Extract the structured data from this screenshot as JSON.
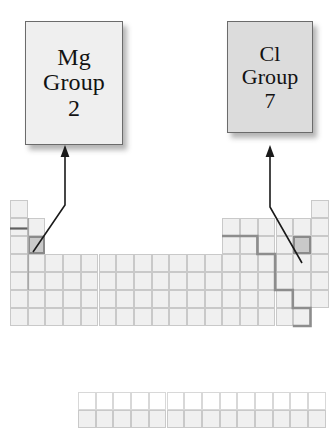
{
  "figure": {
    "kind": "periodic-table-diagram",
    "background": "#ffffff"
  },
  "callouts": [
    {
      "id": "mg",
      "element_symbol": "Mg",
      "group_word": "Group",
      "group_number": "2",
      "box_fill": "#efefef",
      "border_color": "#6b6b6b"
    },
    {
      "id": "cl",
      "element_symbol": "Cl",
      "group_word": "Group",
      "group_number": "7",
      "box_fill": "#dcdcdc",
      "border_color": "#6b6b6b"
    }
  ],
  "table": {
    "columns": 18,
    "cell_width": 17.7,
    "cell_height": 18,
    "origin_x": 10,
    "origin_y": 200,
    "cell_fill": "#f0f0f0",
    "cell_border": "#c9c9c9",
    "highlight_fill": "#c9c9c9",
    "highlight_border": "#8a8a8a",
    "staircase_color": "#8d8d8d",
    "rule_color": "#6e6e6e",
    "main_rows": [
      {
        "period": 1,
        "occupied_columns": [
          1,
          18
        ]
      },
      {
        "period": 2,
        "occupied_columns": [
          1,
          2,
          13,
          14,
          15,
          16,
          17,
          18
        ]
      },
      {
        "period": 3,
        "occupied_columns": [
          1,
          2,
          13,
          14,
          15,
          16,
          17,
          18
        ]
      },
      {
        "period": 4,
        "occupied_columns": [
          1,
          2,
          3,
          4,
          5,
          6,
          7,
          8,
          9,
          10,
          11,
          12,
          13,
          14,
          15,
          16,
          17,
          18
        ]
      },
      {
        "period": 5,
        "occupied_columns": [
          1,
          2,
          3,
          4,
          5,
          6,
          7,
          8,
          9,
          10,
          11,
          12,
          13,
          14,
          15,
          16,
          17,
          18
        ]
      },
      {
        "period": 6,
        "occupied_columns": [
          1,
          2,
          3,
          4,
          5,
          6,
          7,
          8,
          9,
          10,
          11,
          12,
          13,
          14,
          15,
          16,
          17,
          18
        ]
      },
      {
        "period": 7,
        "occupied_columns": [
          1,
          2,
          3,
          4,
          5,
          6,
          7,
          8,
          9,
          10,
          11,
          12,
          13,
          14,
          15,
          16,
          17
        ]
      }
    ],
    "fblock": {
      "rows": 2,
      "columns": 14,
      "origin_x": 78,
      "origin_y": 392,
      "first_row_fill": "#fdfdfd",
      "second_row_fill": "#f0f0f0"
    },
    "highlights": [
      {
        "label": "Mg",
        "column": 2,
        "period": 3
      },
      {
        "label": "Cl",
        "column": 17,
        "period": 3
      }
    ]
  },
  "annotations": {
    "arrow_color": "#1a1a1a",
    "arrows": [
      {
        "id": "arrow-to-mg",
        "points": "33,252 65,205 65,152",
        "head_at": "65,148"
      },
      {
        "id": "arrow-to-cl",
        "points": "302,262 270,207 270,150",
        "head_at": "270,146"
      }
    ]
  }
}
